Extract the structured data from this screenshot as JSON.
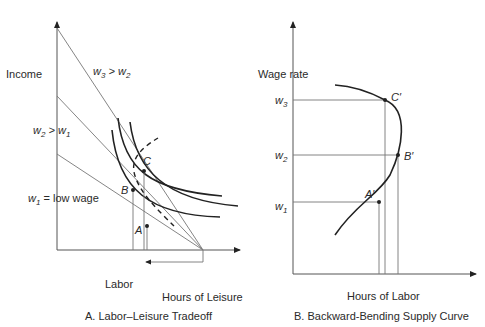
{
  "panel_a": {
    "caption": "A. Labor–Leisure Tradeoff",
    "y_axis_label": "Income",
    "x_axis_label": "Hours of Leisure",
    "labor_label": "Labor",
    "budget_lines": [
      {
        "label_main": "w",
        "sub": "3",
        "rest": " > w",
        "sub2": "2"
      },
      {
        "label_main": "w",
        "sub": "2",
        "rest": " > w",
        "sub2": "1"
      },
      {
        "label_main": "w",
        "sub": "1",
        "rest": " = low wage",
        "sub2": ""
      }
    ],
    "points": [
      "A",
      "B",
      "C"
    ]
  },
  "panel_b": {
    "caption": "B. Backward-Bending Supply Curve",
    "y_axis_label": "Wage rate",
    "x_axis_label": "Hours of Labor",
    "y_ticks": [
      {
        "main": "w",
        "sub": "3"
      },
      {
        "main": "w",
        "sub": "2"
      },
      {
        "main": "w",
        "sub": "1"
      }
    ],
    "points": [
      "A′",
      "B′",
      "C′"
    ]
  },
  "colors": {
    "line": "#222222",
    "axis": "#555555",
    "text": "#2a2a2a"
  }
}
